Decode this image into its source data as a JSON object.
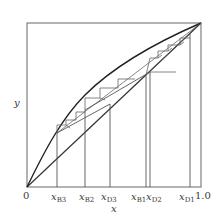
{
  "diagram": {
    "type": "McCabe-Thiele distillation stage diagram",
    "axis": {
      "x_label": "x",
      "y_label": "y",
      "origin_label": "0",
      "end_label": "1.0"
    },
    "tick_labels": [
      {
        "id": "xB3",
        "base": "x",
        "sub": "B3"
      },
      {
        "id": "xB2",
        "base": "x",
        "sub": "B2"
      },
      {
        "id": "xD3",
        "base": "x",
        "sub": "D3"
      },
      {
        "id": "xB1",
        "base": "x",
        "sub": "B1"
      },
      {
        "id": "xD2",
        "base": "x",
        "sub": "D2"
      },
      {
        "id": "xD1",
        "base": "x",
        "sub": "D1"
      }
    ],
    "elements": [
      "equilibrium curve",
      "y=x diagonal",
      "operating lines (3)",
      "stage steps",
      "vertical composition lines"
    ],
    "colors": {
      "line": "#3a3a3a",
      "frame": "#555555",
      "steps": "#6a6a6a"
    }
  }
}
